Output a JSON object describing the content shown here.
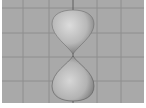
{
  "viewport": {
    "background": "#a9a9a9",
    "grid_color": "#8e8e8e",
    "axis_color": "#5e5e5e",
    "grid_h_lines": [
      8,
      33,
      57,
      81
    ],
    "grid_v_lines": [
      21,
      47,
      95,
      119
    ],
    "axis_line_x": 71
  },
  "object": {
    "name": "double-teardrop-mesh",
    "shading": "smooth-grey",
    "top_lobe": {
      "top": 10,
      "bottom": 54,
      "left": 49,
      "right": 93
    },
    "bottom_lobe": {
      "top": 56,
      "bottom": 101,
      "left": 49,
      "right": 93
    }
  }
}
